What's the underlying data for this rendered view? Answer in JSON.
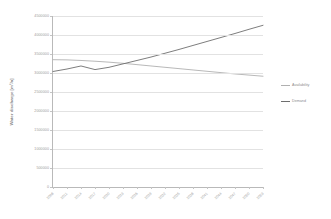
{
  "chart_data": {
    "type": "line",
    "title": "",
    "xlabel": "",
    "ylabel": "Water discharge [m³/a]",
    "ylim": [
      0,
      4500000
    ],
    "grid": true,
    "legend_position": "right",
    "yticks": [
      "4500000",
      "4000000",
      "3500000",
      "3000000",
      "2500000",
      "2000000",
      "1500000",
      "1000000",
      "500000",
      "0"
    ],
    "ytick_values": [
      4500000,
      4000000,
      3500000,
      3000000,
      2500000,
      2000000,
      1500000,
      1000000,
      500000,
      0
    ],
    "categories": [
      "2008",
      "2011",
      "2014",
      "2017",
      "2020",
      "2023",
      "2026",
      "2029",
      "2032",
      "2035",
      "2038",
      "2041",
      "2044",
      "2047",
      "2050",
      "2053"
    ],
    "series": [
      {
        "name": "Availability",
        "color": "#b0b0b0",
        "values": [
          3350000,
          3345000,
          3330000,
          3310000,
          3285000,
          3255000,
          3220000,
          3185000,
          3150000,
          3115000,
          3080000,
          3045000,
          3010000,
          2975000,
          2945000,
          2915000
        ]
      },
      {
        "name": "Demand",
        "color": "#6e6e6e",
        "values": [
          3040000,
          3105000,
          3185000,
          3090000,
          3150000,
          3240000,
          3330000,
          3420000,
          3520000,
          3620000,
          3725000,
          3830000,
          3935000,
          4040000,
          4150000,
          4255000
        ]
      }
    ]
  },
  "legend": {
    "items": [
      {
        "label": "Availability",
        "color": "#b0b0b0"
      },
      {
        "label": "Demand",
        "color": "#6e6e6e"
      }
    ]
  },
  "colors": {
    "background": "#ffffff",
    "grid": "#e2e2e2",
    "axis": "#b9b9b9",
    "tick_text": "#9a9a9a",
    "axis_title": "#8d8d8d"
  }
}
